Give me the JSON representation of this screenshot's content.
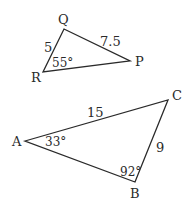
{
  "triangles": [
    {
      "name": "PQR",
      "vertices": {
        "Q": {
          "label": "Q",
          "x": 64,
          "y": 29
        },
        "P": {
          "label": "P",
          "x": 130,
          "y": 61
        },
        "R": {
          "label": "R",
          "x": 43,
          "y": 72
        }
      },
      "sides": {
        "QR": "5",
        "QP": "7.5"
      },
      "angles": {
        "R": "55°"
      }
    },
    {
      "name": "ABC",
      "vertices": {
        "A": {
          "label": "A",
          "x": 25,
          "y": 141
        },
        "C": {
          "label": "C",
          "x": 168,
          "y": 100
        },
        "B": {
          "label": "B",
          "x": 135,
          "y": 182
        }
      },
      "sides": {
        "AC": "15",
        "CB": "9"
      },
      "angles": {
        "A": "33°",
        "B": "92°"
      }
    }
  ],
  "colors": {
    "stroke": "#2a2a2a",
    "background": "#ffffff"
  }
}
